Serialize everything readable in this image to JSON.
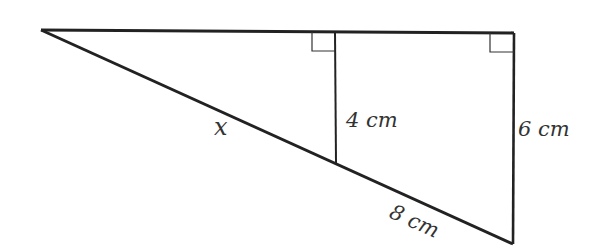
{
  "diagram": {
    "type": "similar-triangles",
    "stroke_color": "#222222",
    "vertices": {
      "apex_left": [
        41,
        30
      ],
      "top_right": [
        514,
        33
      ],
      "bottom_right": [
        513,
        244
      ],
      "mid_top": [
        335,
        32
      ],
      "mid_bottom": [
        336,
        163
      ]
    },
    "labels": {
      "hyp_small": "x",
      "small_height": "4 cm",
      "large_height": "6 cm",
      "hyp_segment": "8 cm"
    }
  }
}
